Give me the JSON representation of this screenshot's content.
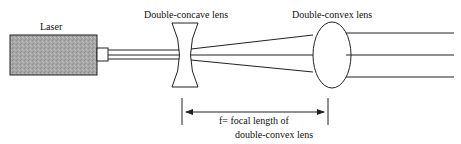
{
  "diagram": {
    "labels": {
      "laser": "Laser",
      "concave": "Double-concave lens",
      "convex": "Double-convex lens",
      "focal_line1": "f= focal length of",
      "focal_line2": "double-convex lens"
    },
    "colors": {
      "stroke": "#222222",
      "laser_fill": "#a8a8a8"
    }
  }
}
